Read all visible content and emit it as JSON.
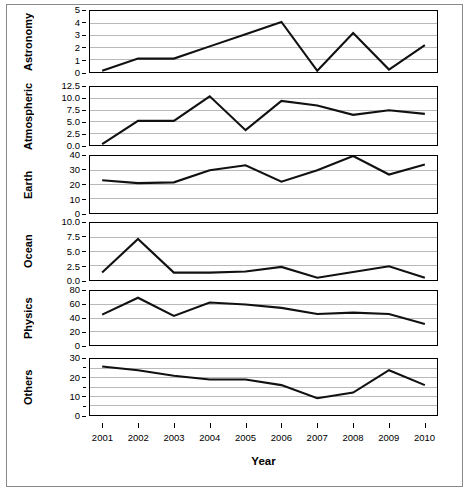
{
  "chart_data": {
    "type": "line",
    "title": "",
    "xlabel": "Year",
    "ylabel": "",
    "grid": true,
    "legend": "none",
    "x": [
      2001,
      2002,
      2003,
      2004,
      2005,
      2006,
      2007,
      2008,
      2009,
      2010
    ],
    "categories": [
      "2001",
      "2002",
      "2003",
      "2004",
      "2005",
      "2006",
      "2007",
      "2008",
      "2009",
      "2010"
    ],
    "panels": [
      {
        "name": "Astronomy",
        "label": "Astronomy",
        "ylim": [
          0,
          5
        ],
        "yticks": [
          0,
          1,
          2,
          3,
          4,
          5
        ],
        "ytick_labels": [
          "0",
          "1",
          "2",
          "3",
          "4",
          "5"
        ],
        "values": [
          0.1,
          1.1,
          1.1,
          2.1,
          3.1,
          4.1,
          0.1,
          3.2,
          0.2,
          2.2
        ]
      },
      {
        "name": "Atmospheric",
        "label": "Atmospheric",
        "ylim": [
          0,
          12.5
        ],
        "yticks": [
          0.0,
          2.5,
          5.0,
          7.5,
          10.0,
          12.5
        ],
        "ytick_labels": [
          "0.0",
          "2.5",
          "5.0",
          "7.5",
          "10.0",
          "12.5"
        ],
        "values": [
          0.2,
          5.2,
          5.2,
          10.5,
          3.2,
          9.5,
          8.5,
          6.5,
          7.5,
          6.7
        ]
      },
      {
        "name": "Earth",
        "label": "Earth",
        "ylim": [
          0,
          40
        ],
        "yticks": [
          0,
          10,
          20,
          30,
          40
        ],
        "ytick_labels": [
          "0",
          "10",
          "20",
          "30",
          "40"
        ],
        "values": [
          23,
          21,
          21.5,
          30,
          33.5,
          22,
          30,
          40,
          27,
          34
        ]
      },
      {
        "name": "Ocean",
        "label": "Ocean",
        "ylim": [
          0,
          10
        ],
        "yticks": [
          0.0,
          2.5,
          5.0,
          7.5,
          10.0
        ],
        "ytick_labels": [
          "0.0",
          "2.5",
          "5.0",
          "7.5",
          "10.0"
        ],
        "values": [
          1.3,
          7.2,
          1.3,
          1.3,
          1.5,
          2.3,
          0.4,
          1.4,
          2.4,
          0.4
        ]
      },
      {
        "name": "Physics",
        "label": "Physics",
        "ylim": [
          0,
          80
        ],
        "yticks": [
          0,
          20,
          40,
          60,
          80
        ],
        "ytick_labels": [
          "0",
          "20",
          "40",
          "60",
          "80"
        ],
        "values": [
          45,
          70,
          43,
          63,
          60,
          55,
          46,
          48,
          46,
          31
        ]
      },
      {
        "name": "Others",
        "label": "Others",
        "ylim": [
          0,
          30
        ],
        "yticks": [
          0,
          10,
          20,
          30
        ],
        "ytick_labels": [
          "0",
          "10",
          "20",
          "30"
        ],
        "minor_yticks": [
          5,
          15,
          25
        ],
        "values": [
          26,
          24,
          21,
          19,
          19,
          16,
          9,
          12,
          24,
          16
        ]
      }
    ]
  }
}
